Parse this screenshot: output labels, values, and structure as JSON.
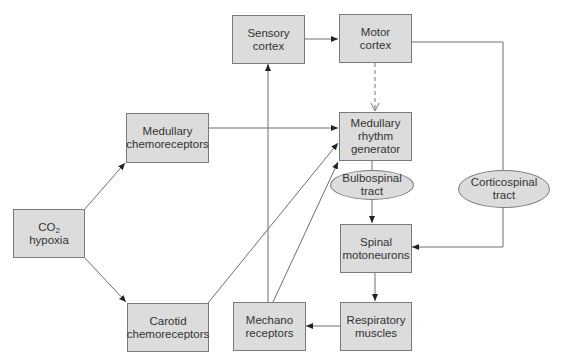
{
  "diagram": {
    "title": "",
    "nodes": {
      "co2_hypoxia": {
        "line1": "CO",
        "line1_sub": "2",
        "line2": "hypoxia",
        "shape": "rect"
      },
      "medullary_chemoreceptors": {
        "line1": "Medullary",
        "line2": "chemoreceptors",
        "shape": "rect"
      },
      "carotid_chemoreceptors": {
        "line1": "Carotid",
        "line2": "chemoreceptors",
        "shape": "rect"
      },
      "sensory_cortex": {
        "line1": "Sensory",
        "line2": "cortex",
        "shape": "rect"
      },
      "motor_cortex": {
        "line1": "Motor",
        "line2": "cortex",
        "shape": "rect"
      },
      "medullary_rhythm_generator": {
        "line1": "Medullary",
        "line2": "rhythm",
        "line3": "generator",
        "shape": "rect"
      },
      "bulbospinal_tract": {
        "line1": "Bulbospinal",
        "line2": "tract",
        "shape": "ellipse"
      },
      "corticospinal_tract": {
        "line1": "Corticospinal",
        "line2": "tract",
        "shape": "ellipse"
      },
      "spinal_motoneurons": {
        "line1": "Spinal",
        "line2": "motoneurons",
        "shape": "rect"
      },
      "respiratory_muscles": {
        "line1": "Respiratory",
        "line2": "muscles",
        "shape": "rect"
      },
      "mechano_receptors": {
        "line1": "Mechano",
        "line2": "receptors",
        "shape": "rect"
      }
    },
    "edges": [
      {
        "from": "co2_hypoxia",
        "to": "medullary_chemoreceptors",
        "style": "solid",
        "arrow": "end"
      },
      {
        "from": "co2_hypoxia",
        "to": "carotid_chemoreceptors",
        "style": "solid",
        "arrow": "end"
      },
      {
        "from": "medullary_chemoreceptors",
        "to": "medullary_rhythm_generator",
        "style": "solid",
        "arrow": "end"
      },
      {
        "from": "carotid_chemoreceptors",
        "to": "medullary_rhythm_generator",
        "style": "solid",
        "arrow": "end"
      },
      {
        "from": "mechano_receptors",
        "to": "medullary_rhythm_generator",
        "style": "solid",
        "arrow": "end"
      },
      {
        "from": "mechano_receptors",
        "to": "sensory_cortex",
        "style": "solid",
        "arrow": "end"
      },
      {
        "from": "sensory_cortex",
        "to": "motor_cortex",
        "style": "solid",
        "arrow": "end"
      },
      {
        "from": "motor_cortex",
        "to": "medullary_rhythm_generator",
        "style": "dashed",
        "arrow": "both-open"
      },
      {
        "from": "motor_cortex",
        "to": "spinal_motoneurons",
        "via": "corticospinal_tract",
        "style": "solid",
        "arrow": "end"
      },
      {
        "from": "medullary_rhythm_generator",
        "to": "spinal_motoneurons",
        "via": "bulbospinal_tract",
        "style": "solid",
        "arrow": "end"
      },
      {
        "from": "spinal_motoneurons",
        "to": "respiratory_muscles",
        "style": "solid",
        "arrow": "end"
      },
      {
        "from": "respiratory_muscles",
        "to": "mechano_receptors",
        "style": "solid",
        "arrow": "end"
      }
    ],
    "colors": {
      "node_fill": "#dcdcdc",
      "node_border": "#7a7a7a",
      "line": "#6e6e6e",
      "text": "#333333"
    }
  }
}
